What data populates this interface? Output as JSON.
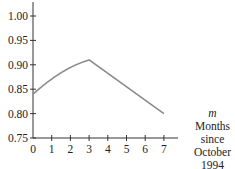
{
  "chart_data": {
    "type": "line",
    "title": "",
    "xlabel": "Months since October 1994",
    "xvar": "m",
    "ylabel": "",
    "x": [
      0,
      1,
      2,
      3,
      4,
      5,
      6,
      7
    ],
    "series": [
      {
        "name": "f(m)",
        "x": [
          0,
          1,
          2,
          3,
          7
        ],
        "values": [
          0.84,
          0.87,
          0.893,
          0.91,
          0.8
        ]
      }
    ],
    "x_ticks": [
      "0",
      "1",
      "2",
      "3",
      "4",
      "5",
      "6",
      "7"
    ],
    "y_ticks": [
      "0.75",
      "0.80",
      "0.85",
      "0.90",
      "0.95",
      "1.00"
    ],
    "xlim": [
      0,
      7.8
    ],
    "ylim": [
      0.75,
      1.03
    ],
    "grid": false,
    "line_color": "#8a8a8a"
  },
  "caption": {
    "var": "m",
    "line1": "Months",
    "line2": "since",
    "line3": "October",
    "line4": "1994"
  }
}
